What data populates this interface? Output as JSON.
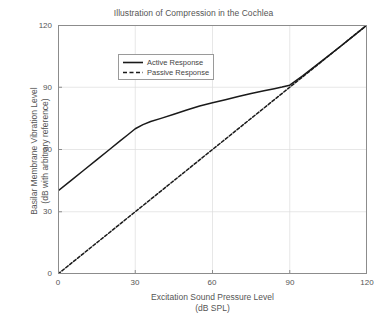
{
  "chart_data": {
    "type": "line",
    "title": "Illustration of Compression in the Cochlea",
    "xlabel": "Excitation Sound Pressure Level",
    "xlabel_units": "(dB SPL)",
    "ylabel": "Basilar Membrane Vibration Level",
    "ylabel_units": "(dB with arbitrary reference)",
    "xlim": [
      0,
      120
    ],
    "ylim": [
      0,
      120
    ],
    "xticks": [
      0,
      30,
      60,
      90,
      120
    ],
    "yticks": [
      0,
      30,
      60,
      90,
      120
    ],
    "xtick_labels": [
      "0",
      "30",
      "60",
      "90",
      "120"
    ],
    "ytick_labels": [
      "0",
      "30",
      "60",
      "90",
      "120"
    ],
    "grid": true,
    "legend_position": "upper left",
    "series": [
      {
        "name": "Active Response",
        "style": "solid",
        "color": "#1a1a1a",
        "x": [
          0,
          5,
          10,
          15,
          20,
          24,
          27,
          30,
          33,
          36,
          40,
          45,
          50,
          55,
          60,
          65,
          70,
          75,
          80,
          84,
          87,
          90,
          95,
          100,
          105,
          110,
          115,
          120
        ],
        "y": [
          40,
          45,
          50,
          55,
          60,
          64,
          67,
          70,
          72,
          73.5,
          75,
          77,
          79,
          81,
          82.5,
          84,
          85.5,
          87,
          88.3,
          89.3,
          90.1,
          91,
          95.5,
          100.3,
          105.1,
          110,
          115,
          120
        ]
      },
      {
        "name": "Passive Response",
        "style": "dashed",
        "color": "#1a1a1a",
        "x": [
          0,
          120
        ],
        "y": [
          0,
          120
        ]
      }
    ]
  },
  "legend": {
    "items": [
      {
        "label": "Active Response",
        "style": "solid"
      },
      {
        "label": "Passive Response",
        "style": "dashed"
      }
    ]
  },
  "axes": {
    "y_ticks": [
      "0",
      "30",
      "60",
      "90",
      "120"
    ],
    "x_ticks": [
      "0",
      "30",
      "60",
      "90",
      "120"
    ]
  }
}
